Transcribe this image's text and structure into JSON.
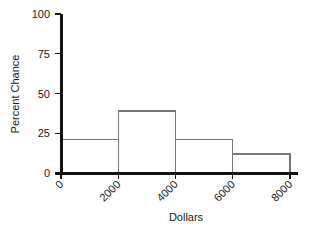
{
  "chart_data": {
    "type": "bar",
    "title": "",
    "subtitle": "",
    "xlabel": "Dollars",
    "ylabel": "Percent Chance",
    "categories": [
      "0-2000",
      "2000-4000",
      "4000-6000",
      "6000-8000"
    ],
    "bin_edges": [
      0,
      2000,
      4000,
      6000,
      8000
    ],
    "values": [
      21,
      39,
      21,
      12
    ],
    "xlim": [
      0,
      8000
    ],
    "ylim": [
      0,
      100
    ],
    "xticks": [
      0,
      2000,
      4000,
      6000,
      8000
    ],
    "xtick_labels": [
      "0",
      "2000",
      "4000",
      "6000",
      "8000"
    ],
    "yticks": [
      0,
      25,
      50,
      75,
      100
    ],
    "ytick_labels": [
      "0",
      "25",
      "50",
      "75",
      "100"
    ],
    "grid": false,
    "legend": null,
    "xtick_rotation_deg": 45,
    "annotations": []
  },
  "style": {
    "background": "#ffffff",
    "axis_color": "#111111",
    "bar_edge_color": "#777777",
    "bar_fill_color": "#ffffff",
    "text_color": "#1a1a1a"
  },
  "geometry": {
    "plot_left": 61,
    "plot_right": 290,
    "plot_top": 14,
    "plot_bottom": 173
  }
}
